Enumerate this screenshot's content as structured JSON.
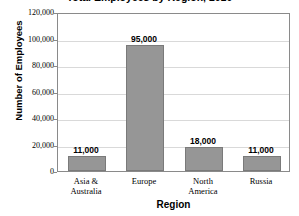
{
  "chart_data": {
    "type": "bar",
    "title": "Total Employees by Region, 2010",
    "xlabel": "Region",
    "ylabel": "Number of Employees",
    "categories": [
      "Asia & Australia",
      "Europe",
      "North America",
      "Russia"
    ],
    "category_lines": [
      [
        "Asia &",
        "Australia"
      ],
      [
        "Europe"
      ],
      [
        "North",
        "America"
      ],
      [
        "Russia"
      ]
    ],
    "values": [
      11000,
      95000,
      18000,
      11000
    ],
    "value_labels": [
      "11,000",
      "95,000",
      "18,000",
      "11,000"
    ],
    "ylim": [
      0,
      120000
    ],
    "ytick_values": [
      0,
      20000,
      40000,
      60000,
      80000,
      100000,
      120000
    ],
    "ytick_labels": [
      "0",
      "20,000",
      "40,000",
      "60,000",
      "80,000",
      "100,000",
      "120,000"
    ],
    "grid": true,
    "legend": false,
    "bar_color": "#969696",
    "bar_border_color": "#7a7a7a",
    "gridline_color": "#d9d9d9",
    "axis_color": "#8a8a8a",
    "background": "#ffffff"
  }
}
